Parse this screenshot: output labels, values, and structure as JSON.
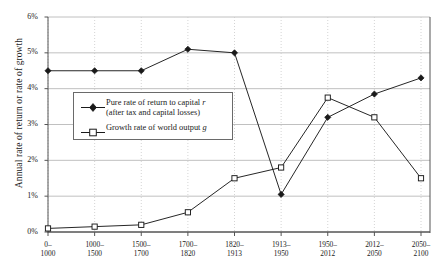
{
  "chart_data": {
    "type": "line",
    "title": "",
    "subtitle": "",
    "xlabel": "",
    "ylabel": "Annual rate of return or rate of growth",
    "categories": [
      "0–\n1000",
      "1000–\n1500",
      "1500–\n1700",
      "1700–\n1820",
      "1820–\n1913",
      "1913–\n1950",
      "1950–\n2012",
      "2012–\n2050",
      "2050–\n2100"
    ],
    "category_lines": [
      [
        "0–",
        "1000"
      ],
      [
        "1000–",
        "1500"
      ],
      [
        "1500–",
        "1700"
      ],
      [
        "1700–",
        "1820"
      ],
      [
        "1820–",
        "1913"
      ],
      [
        "1913–",
        "1950"
      ],
      [
        "1950–",
        "2012"
      ],
      [
        "2012–",
        "2050"
      ],
      [
        "2050–",
        "2100"
      ]
    ],
    "ylim": [
      0,
      6
    ],
    "ytick_values": [
      0,
      1,
      2,
      3,
      4,
      5,
      6
    ],
    "ytick_labels": [
      "0%",
      "1%",
      "2%",
      "3%",
      "4%",
      "5%",
      "6%"
    ],
    "grid": {
      "horizontal": true,
      "vertical": true,
      "vertical_style": "dotted"
    },
    "legend_position": "inside-left",
    "series": [
      {
        "name": "Pure rate of return to capital r (after tax and capital losses)",
        "key": "r",
        "marker": "filled-diamond",
        "values": [
          4.5,
          4.5,
          4.5,
          5.1,
          5.0,
          1.05,
          3.2,
          3.85,
          4.3
        ]
      },
      {
        "name": "Growth rate of world output g",
        "key": "g",
        "marker": "open-square",
        "values": [
          0.1,
          0.15,
          0.2,
          0.55,
          1.5,
          1.8,
          3.75,
          3.2,
          1.5
        ]
      }
    ]
  },
  "legend": {
    "entries": [
      {
        "line1": "Pure rate of return to capital ",
        "symbol1": "r",
        "line2": "(after tax and capital losses)"
      },
      {
        "line1": "Growth rate of world output ",
        "symbol1": "g",
        "line2": ""
      }
    ]
  },
  "axis": {
    "y_title": "Annual rate of return or rate of growth"
  },
  "colors": {
    "series_r": "#1a1a1a",
    "series_g": "#1a1a1a",
    "gridline": "#b9b9b9",
    "vertical_gridline": "#c9c9c9",
    "axis": "#555555",
    "background": "#ffffff"
  }
}
